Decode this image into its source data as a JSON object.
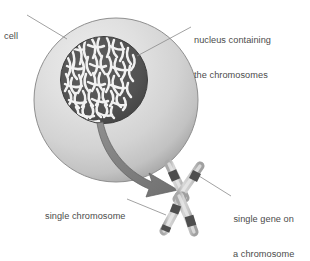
{
  "figure": {
    "background_color": "#ffffff",
    "text_color": "#4b4b4b"
  },
  "labels": {
    "cell": {
      "text": "cell",
      "lines": [
        "cell"
      ]
    },
    "nucleus": {
      "text": "nucleus containing the chromosomes",
      "lines": [
        "nucleus containing",
        "the chromosomes"
      ]
    },
    "single_chromosome": {
      "text": "single chromosome",
      "lines": [
        "single chromosome"
      ]
    },
    "single_gene": {
      "text": "single gene on a chromosome",
      "lines": [
        "single gene on",
        "a chromosome"
      ]
    }
  },
  "parts": {
    "cell_body": {
      "name": "cell",
      "shape": "circle",
      "center": [
        116,
        100
      ],
      "radius": 82,
      "fill_light": "#e8e8e8",
      "fill_mid": "#d2d2d2",
      "fill_edge": "#9a9a9a",
      "stroke": "#8d8d8d"
    },
    "nucleus": {
      "name": "nucleus",
      "shape": "circle",
      "center": [
        104,
        80
      ],
      "radius": 44,
      "fill": "#555555",
      "stroke": "#3f3f3f",
      "chromatin_color": "#f4f4f4",
      "chromatin_strand_count": 62
    },
    "arrow": {
      "name": "magnifier-arrow",
      "from": [
        104,
        122
      ],
      "to": [
        176,
        190
      ],
      "fill": "#7d7d7d",
      "stroke": "#5c5c5c"
    },
    "chromosome": {
      "name": "single chromosome",
      "shape": "x-shaped",
      "centromere": [
        180,
        197
      ],
      "arm_fill": "#d7d7d7",
      "arm_highlight": "#f0f0f0",
      "arm_stroke": "#7e7e7e",
      "band_color": "#4e4e4e",
      "bands": 5
    }
  },
  "leader_lines": [
    {
      "name": "cell-leader",
      "from": [
        27,
        15
      ],
      "to": [
        66,
        39
      ],
      "color": "#8a8a8a"
    },
    {
      "name": "nucleus-leader",
      "from": [
        191,
        27
      ],
      "to": [
        137,
        56
      ],
      "color": "#8a8a8a"
    },
    {
      "name": "single-chromosome-leader",
      "from": [
        126,
        198
      ],
      "to": [
        164,
        213
      ],
      "color": "#8a8a8a"
    },
    {
      "name": "single-gene-leader",
      "from": [
        231,
        196
      ],
      "to": [
        199,
        176
      ],
      "color": "#8a8a8a"
    }
  ]
}
